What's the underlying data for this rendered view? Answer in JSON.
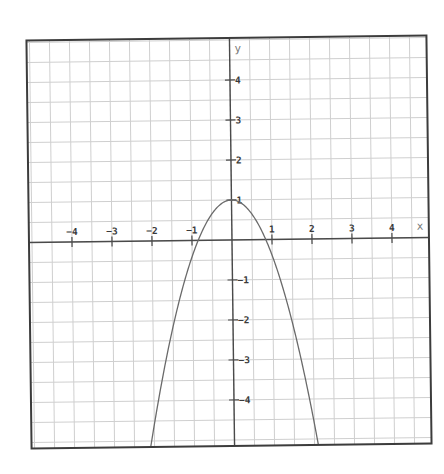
{
  "chart_data": {
    "type": "line",
    "title": "",
    "function": "y = 1 - 1.4x^2",
    "series": [
      {
        "name": "parabola",
        "equation": "y = 1 - a*x^2",
        "a": 1.4,
        "c": 1,
        "vertex": [
          0,
          1
        ],
        "x_intercepts": [
          -0.85,
          0.85
        ],
        "points": [
          [
            -2.05,
            -4.9
          ],
          [
            -1.5,
            -2.15
          ],
          [
            -1.22,
            -1.0
          ],
          [
            -0.85,
            0
          ],
          [
            0,
            1
          ],
          [
            0.85,
            0
          ],
          [
            1.22,
            -1.0
          ],
          [
            1.5,
            -2.15
          ],
          [
            2.05,
            -4.9
          ]
        ]
      }
    ],
    "xlabel": "x",
    "ylabel": "y",
    "xlim": [
      -5.075,
      4.925
    ],
    "ylim": [
      -5.15,
      5.05
    ],
    "x_ticks": [
      -4,
      -3,
      -2,
      -1,
      1,
      2,
      3,
      4
    ],
    "x_tick_labels": [
      "−4",
      "−3",
      "−2",
      "−1",
      "1",
      "2",
      "3",
      "4"
    ],
    "y_ticks": [
      4,
      3,
      2,
      1,
      -1,
      -2,
      -3,
      -4
    ],
    "y_tick_labels": [
      "4",
      "3",
      "2",
      "1",
      "−1",
      "−2",
      "−3",
      "−4"
    ],
    "grid": true,
    "grid_step": 0.5,
    "legend": null,
    "colors": {
      "curve": "#6a6a6a",
      "axis": "#4a4a4a",
      "grid": "#cfcfcf",
      "frame": "#3c3c3c"
    }
  }
}
